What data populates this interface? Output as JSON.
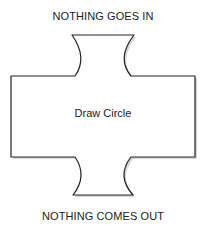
{
  "diagram": {
    "top_label": "NOTHING GOES IN",
    "process_label": "Draw Circle",
    "bottom_label": "NOTHING COMES OUT",
    "stroke_color": "#222222",
    "fill_color": "#ffffff",
    "shadow_color": "#b8b8b8"
  }
}
